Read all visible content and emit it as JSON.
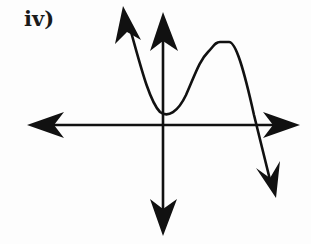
{
  "figure": {
    "label": "iv)",
    "colors": {
      "ink": "#111111",
      "background": "#fdfdfd"
    }
  },
  "axes": {
    "x_axis": {
      "arrows": "both",
      "y_pixel": 125,
      "from_x": 27,
      "to_x": 300
    },
    "y_axis": {
      "arrows": "both",
      "x_pixel": 163,
      "from_y": 8,
      "to_y": 236
    }
  },
  "curve": {
    "left_end": "rises (arrow up-left)",
    "local_min": "near origin, slightly above x-axis",
    "local_max": "in first quadrant",
    "x_intercept": "one positive x-intercept",
    "right_end": "falls (arrow down-right)"
  }
}
